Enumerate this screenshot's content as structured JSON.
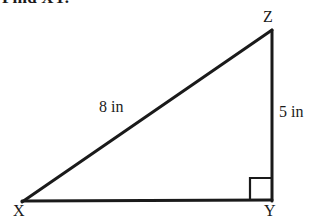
{
  "prompt": {
    "text": "Find XY."
  },
  "figure": {
    "name": "right-triangle-xyz",
    "stroke_color": "#1a1a1a",
    "background_color": "#ffffff",
    "vertices": [
      {
        "id": "X",
        "label": "X",
        "x": 22,
        "y": 202
      },
      {
        "id": "Y",
        "label": "Y",
        "x": 272,
        "y": 200
      },
      {
        "id": "Z",
        "label": "Z",
        "x": 272,
        "y": 30
      }
    ],
    "sides": [
      {
        "id": "XZ",
        "from": "X",
        "to": "Z",
        "label": "8 in",
        "role": "hypotenuse"
      },
      {
        "id": "YZ",
        "from": "Y",
        "to": "Z",
        "label": "5 in",
        "role": "vertical-leg"
      },
      {
        "id": "XY",
        "from": "X",
        "to": "Y",
        "label": "",
        "role": "base-leg-unknown"
      }
    ],
    "right_angle": {
      "at": "Y",
      "marker_size": 21
    }
  }
}
